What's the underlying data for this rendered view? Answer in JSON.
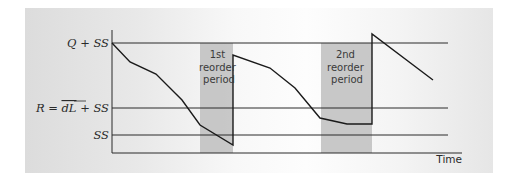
{
  "chart_data": {
    "type": "line",
    "title": "",
    "xlabel": "Time",
    "ylabel": "",
    "grid": false,
    "y_levels": [
      {
        "name": "q_plus_ss",
        "label": "Q + SS",
        "value": 43
      },
      {
        "name": "reorder_point",
        "label": "R = dL + SS",
        "value": 108
      },
      {
        "name": "safety_stock",
        "label": "SS",
        "value": 135
      }
    ],
    "series": [
      {
        "name": "Inventory level",
        "points": [
          [
            112,
            43
          ],
          [
            130,
            62
          ],
          [
            156,
            74
          ],
          [
            182,
            100
          ],
          [
            200,
            125
          ],
          [
            233,
            145
          ],
          [
            233,
            55
          ],
          [
            270,
            68
          ],
          [
            295,
            88
          ],
          [
            320,
            118
          ],
          [
            347,
            124
          ],
          [
            372,
            124
          ],
          [
            372,
            34
          ],
          [
            433,
            80
          ]
        ]
      }
    ],
    "shaded_regions": [
      {
        "label_lines": [
          "1st",
          "reorder",
          "period"
        ],
        "x_start": 200,
        "x_end": 233
      },
      {
        "label_lines": [
          "2nd",
          "reorder",
          "period"
        ],
        "x_start": 321,
        "x_end": 372
      }
    ],
    "colors": {
      "line": "#1a1a1a",
      "shade": "#c2c2c2"
    }
  },
  "labels": {
    "q_plus_ss": "Q + SS",
    "r_prefix": "R = ",
    "r_dl": "dL",
    "r_suffix": " + SS",
    "ss": "SS",
    "time": "Time",
    "period1": [
      "1st",
      "reorder",
      "period"
    ],
    "period2": [
      "2nd",
      "reorder",
      "period"
    ]
  }
}
